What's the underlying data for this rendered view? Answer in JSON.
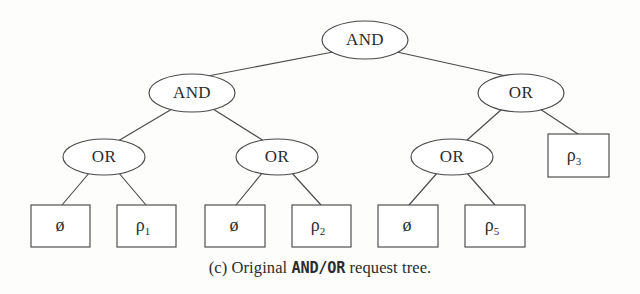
{
  "figure": {
    "caption_prefix": "(c) Original ",
    "caption_emphasis": "AND/OR",
    "caption_suffix": " request tree.",
    "caption_full": "(c) Original AND/OR request tree."
  },
  "colors": {
    "stroke": "#4a4a4a",
    "text": "#2b2b2b",
    "background": "#fdfdfc",
    "node_fill": "#ffffff"
  },
  "tree": {
    "type": "and-or-request-tree",
    "nodes": [
      {
        "id": "n0",
        "label": "AND",
        "shape": "ellipse",
        "level": 0,
        "cx": 365,
        "cy": 40,
        "rx": 43,
        "ry": 19
      },
      {
        "id": "n1",
        "label": "AND",
        "shape": "ellipse",
        "level": 1,
        "cx": 192,
        "cy": 93,
        "rx": 43,
        "ry": 19
      },
      {
        "id": "n2",
        "label": "OR",
        "shape": "ellipse",
        "level": 1,
        "cx": 521,
        "cy": 93,
        "rx": 43,
        "ry": 19
      },
      {
        "id": "n3",
        "label": "OR",
        "shape": "ellipse",
        "level": 2,
        "cx": 104,
        "cy": 157,
        "rx": 41,
        "ry": 18
      },
      {
        "id": "n4",
        "label": "OR",
        "shape": "ellipse",
        "level": 2,
        "cx": 277,
        "cy": 157,
        "rx": 41,
        "ry": 18
      },
      {
        "id": "n5",
        "label": "OR",
        "shape": "ellipse",
        "level": 2,
        "cx": 452,
        "cy": 157,
        "rx": 41,
        "ry": 18
      },
      {
        "id": "l3",
        "label": "ρ",
        "sub": "3",
        "shape": "rect",
        "level": 2,
        "x": 548,
        "y": 134,
        "w": 61,
        "h": 43
      },
      {
        "id": "l0",
        "label": "ø",
        "sub": "",
        "shape": "rect",
        "level": 3,
        "x": 31,
        "y": 205,
        "w": 59,
        "h": 42
      },
      {
        "id": "l1",
        "label": "ρ",
        "sub": "1",
        "shape": "rect",
        "level": 3,
        "x": 117,
        "y": 205,
        "w": 59,
        "h": 42
      },
      {
        "id": "l2",
        "label": "ø",
        "sub": "",
        "shape": "rect",
        "level": 3,
        "x": 205,
        "y": 205,
        "w": 60,
        "h": 42
      },
      {
        "id": "l4",
        "label": "ρ",
        "sub": "2",
        "shape": "rect",
        "level": 3,
        "x": 292,
        "y": 205,
        "w": 59,
        "h": 42
      },
      {
        "id": "l5",
        "label": "ø",
        "sub": "",
        "shape": "rect",
        "level": 3,
        "x": 378,
        "y": 205,
        "w": 60,
        "h": 42
      },
      {
        "id": "l6",
        "label": "ρ",
        "sub": "5",
        "shape": "rect",
        "level": 3,
        "x": 465,
        "y": 205,
        "w": 60,
        "h": 42
      }
    ],
    "edges": [
      {
        "from": "n0",
        "to": "n1",
        "x1": 333,
        "y1": 52,
        "x2": 208,
        "y2": 76
      },
      {
        "from": "n0",
        "to": "n2",
        "x1": 397,
        "y1": 52,
        "x2": 506,
        "y2": 76
      },
      {
        "from": "n1",
        "to": "n3",
        "x1": 172,
        "y1": 109,
        "x2": 118,
        "y2": 141
      },
      {
        "from": "n1",
        "to": "n4",
        "x1": 213,
        "y1": 109,
        "x2": 264,
        "y2": 141
      },
      {
        "from": "n2",
        "to": "n5",
        "x1": 502,
        "y1": 109,
        "x2": 466,
        "y2": 141
      },
      {
        "from": "n2",
        "to": "l3",
        "x1": 540,
        "y1": 109,
        "x2": 578,
        "y2": 134
      },
      {
        "from": "n3",
        "to": "l0",
        "x1": 90,
        "y1": 172,
        "x2": 62,
        "y2": 205
      },
      {
        "from": "n3",
        "to": "l1",
        "x1": 118,
        "y1": 172,
        "x2": 146,
        "y2": 205
      },
      {
        "from": "n4",
        "to": "l2",
        "x1": 263,
        "y1": 172,
        "x2": 236,
        "y2": 205
      },
      {
        "from": "n4",
        "to": "l4",
        "x1": 291,
        "y1": 172,
        "x2": 321,
        "y2": 205
      },
      {
        "from": "n5",
        "to": "l5",
        "x1": 438,
        "y1": 172,
        "x2": 409,
        "y2": 205
      },
      {
        "from": "n5",
        "to": "l6",
        "x1": 466,
        "y1": 172,
        "x2": 495,
        "y2": 205
      }
    ]
  }
}
